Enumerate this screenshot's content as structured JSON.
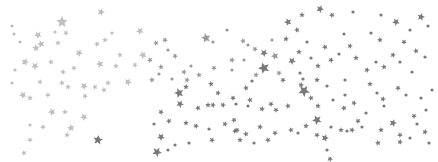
{
  "image": {
    "description": "Scattered gray confetti stars and dots on a white background",
    "width": 438,
    "height": 162,
    "background": "#ffffff",
    "colors": {
      "light_star": "#b4b4b4",
      "mid_star": "#8e8e8e",
      "dark_star": "#6b6b6b"
    },
    "stars": [
      [
        62,
        22,
        6,
        "light"
      ],
      [
        101,
        12,
        4,
        "light"
      ],
      [
        38,
        35,
        4,
        "light"
      ],
      [
        36,
        48,
        4,
        "light"
      ],
      [
        12,
        26,
        2,
        "light"
      ],
      [
        14,
        34,
        2,
        "light"
      ],
      [
        20,
        42,
        2,
        "light"
      ],
      [
        55,
        32,
        2,
        "light"
      ],
      [
        66,
        33,
        3,
        "light"
      ],
      [
        41,
        44,
        4,
        "light"
      ],
      [
        58,
        43,
        3,
        "light"
      ],
      [
        79,
        53,
        4,
        "light"
      ],
      [
        97,
        44,
        3,
        "light"
      ],
      [
        105,
        40,
        3,
        "light"
      ],
      [
        112,
        33,
        2,
        "light"
      ],
      [
        140,
        31,
        4,
        "light"
      ],
      [
        120,
        55,
        3,
        "light"
      ],
      [
        25,
        62,
        4,
        "light"
      ],
      [
        35,
        66,
        4,
        "light"
      ],
      [
        51,
        62,
        3,
        "light"
      ],
      [
        63,
        72,
        3,
        "light"
      ],
      [
        74,
        68,
        3,
        "light"
      ],
      [
        100,
        64,
        4,
        "light"
      ],
      [
        116,
        66,
        3,
        "light"
      ],
      [
        135,
        65,
        3,
        "light"
      ],
      [
        143,
        55,
        4,
        "light"
      ],
      [
        15,
        70,
        2,
        "light"
      ],
      [
        12,
        83,
        2,
        "light"
      ],
      [
        23,
        95,
        4,
        "light"
      ],
      [
        30,
        98,
        3,
        "light"
      ],
      [
        40,
        82,
        3,
        "light"
      ],
      [
        48,
        95,
        3,
        "light"
      ],
      [
        62,
        83,
        3,
        "light"
      ],
      [
        68,
        87,
        3,
        "light"
      ],
      [
        84,
        86,
        4,
        "light"
      ],
      [
        95,
        87,
        3,
        "light"
      ],
      [
        108,
        83,
        3,
        "light"
      ],
      [
        128,
        82,
        4,
        "light"
      ],
      [
        52,
        112,
        4,
        "light"
      ],
      [
        65,
        112,
        3,
        "light"
      ],
      [
        85,
        96,
        3,
        "light"
      ],
      [
        84,
        117,
        4,
        "light"
      ],
      [
        104,
        90,
        3,
        "light"
      ],
      [
        30,
        125,
        2,
        "light"
      ],
      [
        43,
        127,
        3,
        "light"
      ],
      [
        71,
        128,
        4,
        "light"
      ],
      [
        67,
        135,
        3,
        "light"
      ],
      [
        30,
        140,
        3,
        "light"
      ],
      [
        24,
        153,
        3,
        "light"
      ],
      [
        97,
        139,
        3,
        "light"
      ],
      [
        165,
        40,
        3,
        "mid"
      ],
      [
        156,
        43,
        3,
        "mid"
      ],
      [
        168,
        50,
        2,
        "mid"
      ],
      [
        175,
        56,
        3,
        "mid"
      ],
      [
        150,
        60,
        3,
        "mid"
      ],
      [
        161,
        67,
        3,
        "mid"
      ],
      [
        184,
        72,
        3,
        "mid"
      ],
      [
        191,
        66,
        2,
        "mid"
      ],
      [
        206,
        38,
        5,
        "mid"
      ],
      [
        213,
        42,
        2,
        "mid"
      ],
      [
        227,
        30,
        2,
        "mid"
      ],
      [
        243,
        41,
        3,
        "mid"
      ],
      [
        248,
        45,
        2,
        "mid"
      ],
      [
        255,
        49,
        3,
        "mid"
      ],
      [
        275,
        56,
        4,
        "mid"
      ],
      [
        272,
        40,
        2,
        "mid"
      ],
      [
        232,
        60,
        3,
        "mid"
      ],
      [
        244,
        60,
        2,
        "mid"
      ],
      [
        199,
        75,
        3,
        "mid"
      ],
      [
        187,
        80,
        3,
        "mid"
      ],
      [
        172,
        79,
        2,
        "mid"
      ],
      [
        152,
        80,
        3,
        "mid"
      ],
      [
        159,
        74,
        2,
        "mid"
      ],
      [
        214,
        68,
        3,
        "mid"
      ],
      [
        232,
        70,
        2,
        "mid"
      ],
      [
        256,
        75,
        3,
        "mid"
      ],
      [
        279,
        73,
        3,
        "mid"
      ],
      [
        288,
        22,
        4,
        "dark"
      ],
      [
        302,
        15,
        3,
        "dark"
      ],
      [
        320,
        9,
        4,
        "dark"
      ],
      [
        332,
        15,
        3,
        "dark"
      ],
      [
        353,
        12,
        2,
        "dark"
      ],
      [
        381,
        15,
        2,
        "dark"
      ],
      [
        396,
        22,
        4,
        "dark"
      ],
      [
        410,
        30,
        2,
        "dark"
      ],
      [
        421,
        17,
        4,
        "dark"
      ],
      [
        428,
        26,
        2,
        "dark"
      ],
      [
        297,
        30,
        3,
        "dark"
      ],
      [
        286,
        39,
        3,
        "dark"
      ],
      [
        264,
        53,
        4,
        "dark"
      ],
      [
        264,
        68,
        6,
        "dark"
      ],
      [
        299,
        52,
        3,
        "dark"
      ],
      [
        307,
        42,
        2,
        "dark"
      ],
      [
        325,
        47,
        3,
        "dark"
      ],
      [
        344,
        34,
        2,
        "dark"
      ],
      [
        350,
        46,
        3,
        "dark"
      ],
      [
        371,
        33,
        2,
        "dark"
      ],
      [
        380,
        40,
        3,
        "dark"
      ],
      [
        393,
        55,
        3,
        "dark"
      ],
      [
        404,
        42,
        3,
        "dark"
      ],
      [
        416,
        51,
        3,
        "dark"
      ],
      [
        425,
        57,
        2,
        "dark"
      ],
      [
        292,
        61,
        4,
        "dark"
      ],
      [
        311,
        58,
        2,
        "dark"
      ],
      [
        318,
        66,
        3,
        "dark"
      ],
      [
        331,
        60,
        3,
        "dark"
      ],
      [
        339,
        54,
        2,
        "dark"
      ],
      [
        356,
        58,
        3,
        "dark"
      ],
      [
        367,
        70,
        3,
        "dark"
      ],
      [
        376,
        62,
        2,
        "dark"
      ],
      [
        384,
        67,
        3,
        "dark"
      ],
      [
        400,
        62,
        2,
        "dark"
      ],
      [
        412,
        72,
        2,
        "dark"
      ],
      [
        246,
        88,
        3,
        "dark"
      ],
      [
        252,
        81,
        2,
        "dark"
      ],
      [
        283,
        80,
        3,
        "dark"
      ],
      [
        303,
        79,
        2,
        "dark"
      ],
      [
        317,
        80,
        3,
        "dark"
      ],
      [
        327,
        86,
        2,
        "dark"
      ],
      [
        345,
        80,
        2,
        "dark"
      ],
      [
        370,
        84,
        3,
        "dark"
      ],
      [
        377,
        93,
        2,
        "dark"
      ],
      [
        398,
        88,
        3,
        "dark"
      ],
      [
        211,
        84,
        3,
        "dark"
      ],
      [
        218,
        93,
        3,
        "dark"
      ],
      [
        233,
        98,
        3,
        "dark"
      ],
      [
        250,
        100,
        3,
        "dark"
      ],
      [
        262,
        109,
        3,
        "dark"
      ],
      [
        271,
        104,
        3,
        "dark"
      ],
      [
        179,
        93,
        5,
        "dark"
      ],
      [
        186,
        87,
        3,
        "dark"
      ],
      [
        180,
        104,
        4,
        "dark"
      ],
      [
        198,
        108,
        3,
        "dark"
      ],
      [
        208,
        105,
        3,
        "dark"
      ],
      [
        223,
        105,
        3,
        "dark"
      ],
      [
        234,
        120,
        3,
        "dark"
      ],
      [
        236,
        104,
        2,
        "dark"
      ],
      [
        248,
        106,
        2,
        "dark"
      ],
      [
        276,
        110,
        3,
        "dark"
      ],
      [
        288,
        106,
        3,
        "dark"
      ],
      [
        301,
        85,
        3,
        "dark"
      ],
      [
        304,
        91,
        6,
        "dark"
      ],
      [
        311,
        98,
        3,
        "dark"
      ],
      [
        318,
        106,
        3,
        "dark"
      ],
      [
        333,
        100,
        2,
        "dark"
      ],
      [
        344,
        108,
        3,
        "dark"
      ],
      [
        345,
        95,
        2,
        "dark"
      ],
      [
        354,
        103,
        3,
        "dark"
      ],
      [
        358,
        121,
        3,
        "dark"
      ],
      [
        366,
        113,
        2,
        "dark"
      ],
      [
        383,
        99,
        3,
        "dark"
      ],
      [
        384,
        106,
        2,
        "dark"
      ],
      [
        406,
        95,
        2,
        "dark"
      ],
      [
        421,
        98,
        2,
        "dark"
      ],
      [
        414,
        116,
        3,
        "dark"
      ],
      [
        426,
        110,
        2,
        "dark"
      ],
      [
        432,
        90,
        2,
        "dark"
      ],
      [
        161,
        112,
        3,
        "dark"
      ],
      [
        169,
        121,
        3,
        "dark"
      ],
      [
        186,
        123,
        3,
        "dark"
      ],
      [
        196,
        126,
        3,
        "dark"
      ],
      [
        154,
        124,
        2,
        "dark"
      ],
      [
        209,
        129,
        2,
        "dark"
      ],
      [
        225,
        124,
        3,
        "dark"
      ],
      [
        237,
        130,
        3,
        "dark"
      ],
      [
        246,
        134,
        3,
        "dark"
      ],
      [
        260,
        127,
        3,
        "dark"
      ],
      [
        275,
        133,
        3,
        "dark"
      ],
      [
        291,
        130,
        3,
        "dark"
      ],
      [
        306,
        126,
        3,
        "dark"
      ],
      [
        317,
        135,
        3,
        "dark"
      ],
      [
        331,
        127,
        2,
        "dark"
      ],
      [
        341,
        130,
        3,
        "dark"
      ],
      [
        352,
        130,
        3,
        "dark"
      ],
      [
        362,
        127,
        2,
        "dark"
      ],
      [
        381,
        130,
        3,
        "dark"
      ],
      [
        393,
        123,
        4,
        "dark"
      ],
      [
        400,
        135,
        3,
        "dark"
      ],
      [
        417,
        124,
        2,
        "dark"
      ],
      [
        425,
        132,
        3,
        "dark"
      ],
      [
        161,
        137,
        4,
        "dark"
      ],
      [
        175,
        145,
        2,
        "dark"
      ],
      [
        189,
        143,
        2,
        "dark"
      ],
      [
        212,
        140,
        3,
        "dark"
      ],
      [
        235,
        131,
        3,
        "dark"
      ],
      [
        240,
        140,
        3,
        "dark"
      ],
      [
        254,
        143,
        2,
        "dark"
      ],
      [
        268,
        140,
        3,
        "dark"
      ],
      [
        298,
        133,
        2,
        "dark"
      ],
      [
        325,
        138,
        4,
        "dark"
      ],
      [
        347,
        131,
        2,
        "dark"
      ],
      [
        378,
        143,
        3,
        "dark"
      ],
      [
        400,
        142,
        3,
        "dark"
      ],
      [
        410,
        138,
        2,
        "dark"
      ],
      [
        429,
        143,
        2,
        "dark"
      ],
      [
        98,
        140,
        5,
        "dark"
      ],
      [
        157,
        152,
        5,
        "dark"
      ],
      [
        168,
        150,
        2,
        "dark"
      ],
      [
        327,
        150,
        2,
        "dark"
      ],
      [
        330,
        159,
        3,
        "dark"
      ],
      [
        317,
        120,
        5,
        "dark"
      ],
      [
        300,
        73,
        2,
        "dark"
      ],
      [
        213,
        105,
        3,
        "dark"
      ]
    ]
  }
}
